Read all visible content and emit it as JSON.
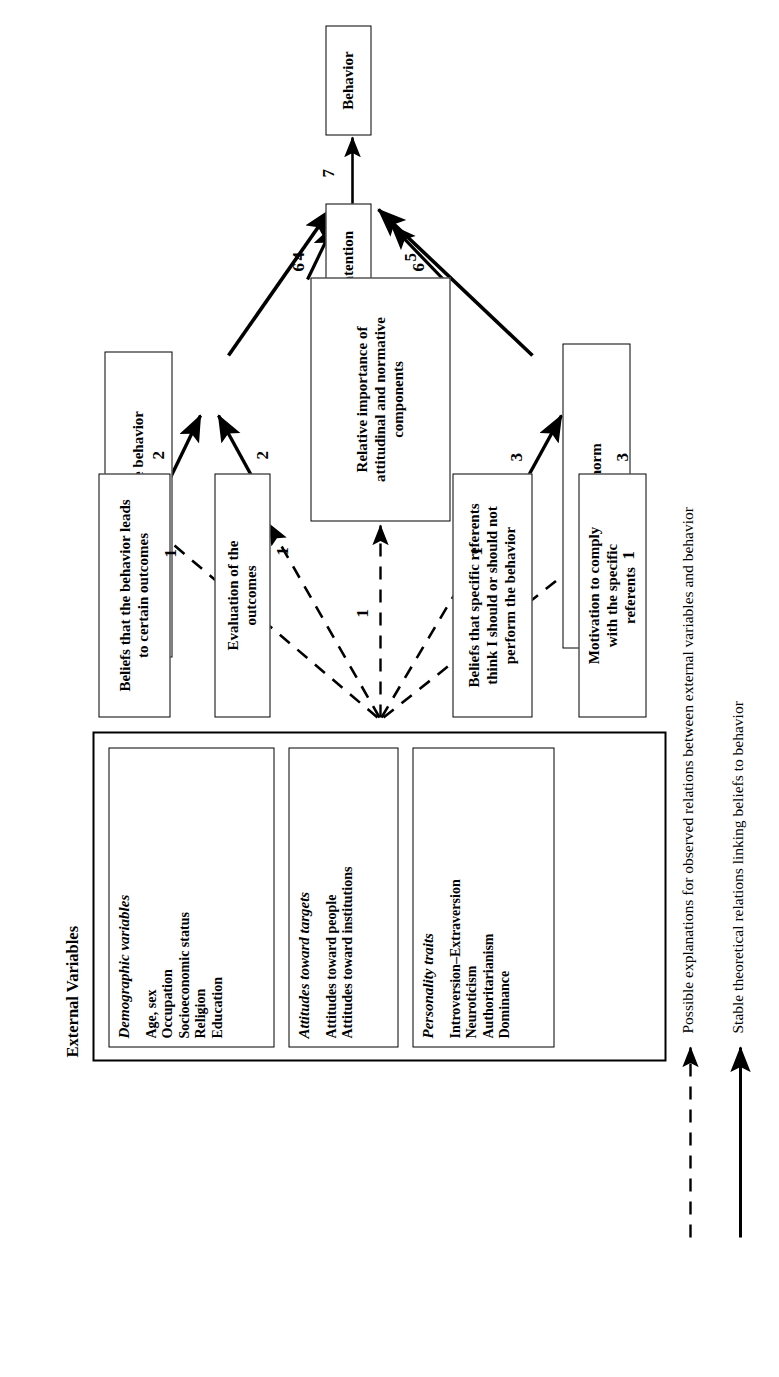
{
  "figure": {
    "orientation": "rotated-90-ccw"
  },
  "nodes": {
    "behavior": {
      "label": "Behavior"
    },
    "intention": {
      "label": "Intention"
    },
    "attitude": {
      "label": "Attitude toward the behavior"
    },
    "relative_importance": {
      "label": "Relative importance of attitudinal and normative components"
    },
    "subjective_norm": {
      "label": "Subjective norm"
    },
    "beliefs_outcomes": {
      "label": "Beliefs that the behavior leads to certain outcomes"
    },
    "evaluation_outcomes": {
      "label": "Evaluation of the outcomes"
    },
    "beliefs_referents": {
      "label": "Beliefs that specific referents think I should or should not perform the behavior"
    },
    "motivation_comply": {
      "label": "Motivation to comply with the specific referents"
    }
  },
  "external_variables": {
    "title": "External Variables",
    "groups": [
      {
        "heading": "Demographic variables",
        "items": [
          "Age, sex",
          "Occupation",
          "Socioeconomic status",
          "Religion",
          "Education"
        ]
      },
      {
        "heading": "Attitudes toward targets",
        "items": [
          "Attitudes toward people",
          "Attitudes toward institutions"
        ]
      },
      {
        "heading": "Personality traits",
        "items": [
          "Introversion–Extraversion",
          "Neuroticism",
          "Authoritarianism",
          "Dominance"
        ]
      }
    ]
  },
  "edge_labels": {
    "to_behavior": "7",
    "attitude_to_intention": "4",
    "norm_to_intention": "5",
    "relimp_to_intention_left": "6",
    "relimp_to_intention_right": "6",
    "beliefs_to_attitude": "2",
    "evaluation_to_attitude": "2",
    "referents_to_norm": "3",
    "motivation_to_norm": "3",
    "external_to_beliefs": "1",
    "external_to_evaluation": "1",
    "external_to_relimp": "1",
    "external_to_referents": "1",
    "external_to_motivation": "1"
  },
  "legend": {
    "items": [
      {
        "style": "dashed-arrow",
        "text": "Possible explanations for observed relations between external variables and behavior"
      },
      {
        "style": "solid-arrow",
        "text": "Stable theoretical relations linking beliefs to behavior"
      }
    ]
  },
  "colors": {
    "stroke": "#000000",
    "background": "#ffffff"
  }
}
